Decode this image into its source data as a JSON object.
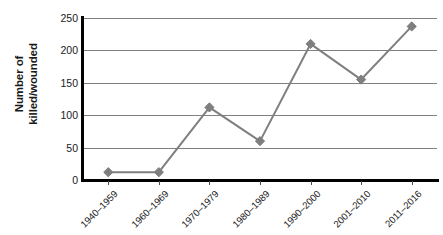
{
  "chart_data": {
    "type": "line",
    "title": "",
    "xlabel": "",
    "ylabel": "Number of killed/wounded",
    "ylabel_line1": "Number of",
    "ylabel_line2": "killed/wounded",
    "categories": [
      "1940–1959",
      "1960–1969",
      "1970–1979",
      "1980–1989",
      "1990–2000",
      "2001–2010",
      "2011–2016"
    ],
    "values": [
      12,
      12,
      112,
      60,
      210,
      155,
      237
    ],
    "ylim": [
      0,
      250
    ],
    "yticks": [
      0,
      50,
      100,
      150,
      200,
      250
    ],
    "ytick_labels": [
      "0",
      "50",
      "100",
      "150",
      "200",
      "250"
    ],
    "grid": true,
    "legend": "none",
    "series_color": "#7f7f7f",
    "marker": "diamond",
    "axis_color": "#000000",
    "gridline_color": "#808080"
  }
}
